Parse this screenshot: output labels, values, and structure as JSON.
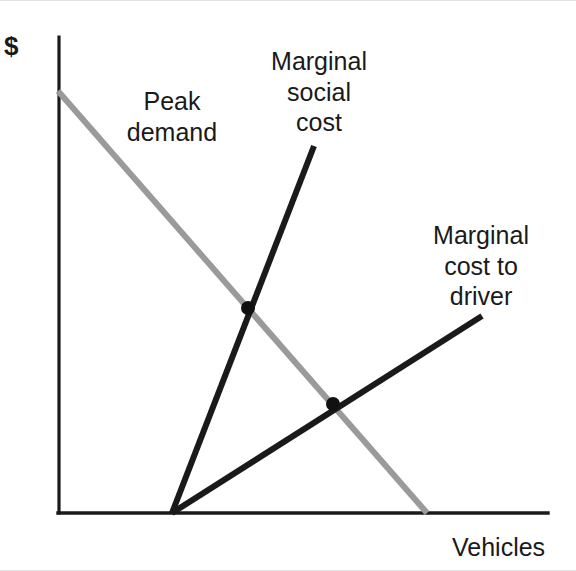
{
  "figure": {
    "background_color": "#ffffff",
    "width": 576,
    "height": 571
  },
  "axes": {
    "y_label": "$",
    "x_label": "Vehicles",
    "axis_color": "#1a1a1a"
  },
  "labels": {
    "peak_demand": "Peak\ndemand",
    "marginal_social_cost": "Marginal\nsocial\ncost",
    "marginal_cost_to_driver": "Marginal\ncost to\ndriver"
  },
  "colors": {
    "demand_curve": "#9a9a9a",
    "marginal_social_cost_curve": "#1a1a1a",
    "marginal_cost_to_driver_curve": "#1a1a1a",
    "intersection_dot": "#111111",
    "axis": "#1a1a1a"
  },
  "chart_data": {
    "type": "line",
    "title": "",
    "xlabel": "Vehicles",
    "ylabel": "$",
    "grid": false,
    "legend": "inline-annotations",
    "axis_origin_px": [
      58,
      512
    ],
    "axis_x_end_px": [
      548,
      512
    ],
    "axis_y_top_px": [
      58,
      36
    ],
    "xlim": [
      0,
      100
    ],
    "ylim": [
      0,
      100
    ],
    "series": [
      {
        "name": "Peak demand",
        "color": "#9a9a9a",
        "style": "downward-sloping straight line",
        "points_px": [
          [
            58,
            90
          ],
          [
            427,
            512
          ]
        ],
        "x": [
          0,
          75.3
        ],
        "y": [
          88.6,
          0
        ]
      },
      {
        "name": "Marginal social cost",
        "color": "#1a1a1a",
        "style": "upward-sloping steep straight line from x-axis",
        "points_px": [
          [
            172,
            512
          ],
          [
            314,
            145
          ]
        ],
        "x": [
          23.3,
          52.2
        ],
        "y": [
          0,
          77.1
        ]
      },
      {
        "name": "Marginal cost to driver",
        "color": "#1a1a1a",
        "style": "upward-sloping shallow straight line from x-axis",
        "points_px": [
          [
            172,
            512
          ],
          [
            482,
            315
          ]
        ],
        "x": [
          23.3,
          86.5
        ],
        "y": [
          0,
          41.4
        ]
      }
    ],
    "annotations": [
      {
        "name": "intersection-demand-msc",
        "label": "",
        "point_px": [
          248,
          307
        ],
        "x": [
          38.8
        ],
        "y": [
          43.1
        ],
        "marker": "filled-dot"
      },
      {
        "name": "intersection-demand-mcd",
        "label": "",
        "point_px": [
          333,
          403
        ],
        "x": [
          56.1
        ],
        "y": [
          22.9
        ],
        "marker": "filled-dot"
      }
    ]
  }
}
